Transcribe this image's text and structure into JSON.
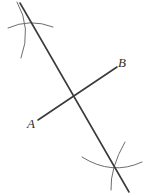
{
  "figure": {
    "width": 145,
    "height": 194,
    "background_color": "#ffffff",
    "line_color": "#3a3a3a",
    "arc_color": "#6d6d6d",
    "label_color": "#2e2e2e",
    "labels": [
      {
        "id": "A",
        "text": "A",
        "x": 27,
        "y": 117
      },
      {
        "id": "B",
        "text": "B",
        "x": 118,
        "y": 56
      }
    ],
    "segments": [
      {
        "name": "construction-line",
        "x1": 20,
        "y1": 3,
        "x2": 129,
        "y2": 192,
        "stroke_width": 1.6
      },
      {
        "name": "segment-ab",
        "x1": 38,
        "y1": 120,
        "x2": 117,
        "y2": 67,
        "stroke_width": 1.6
      }
    ],
    "arcs": [
      {
        "name": "upper-arc-horizontal",
        "d": "M 8 28 Q 30 18 53 27",
        "stroke_width": 1.0
      },
      {
        "name": "upper-arc-vertical",
        "d": "M 17 2 Q 32 28 21 58",
        "stroke_width": 1.0
      },
      {
        "name": "lower-arc-horizontal",
        "d": "M 82 157 Q 112 176 142 162",
        "stroke_width": 1.0
      },
      {
        "name": "lower-arc-vertical",
        "d": "M 125 142 Q 110 168 111 190",
        "stroke_width": 1.0
      }
    ],
    "intersections": [
      {
        "name": "upper-arc-intersection",
        "x": 24,
        "y": 25
      },
      {
        "name": "lower-arc-intersection",
        "x": 117,
        "y": 165
      },
      {
        "name": "lines-intersection",
        "x": 75,
        "y": 98
      }
    ]
  }
}
